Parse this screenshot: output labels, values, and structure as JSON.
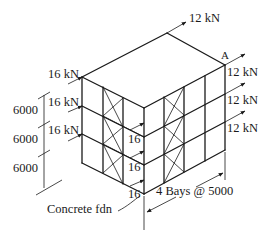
{
  "diagram": {
    "type": "isometric-braced-frame",
    "loads": {
      "top_back": "12 kN",
      "left_face": [
        "16 kN",
        "16 kN",
        "16 kN"
      ],
      "right_face": [
        "12 kN",
        "12 kN",
        "12 kN"
      ],
      "front_corner": [
        "16",
        "16",
        "16"
      ]
    },
    "corner_label": "A",
    "story_heights": [
      "6000",
      "6000",
      "6000"
    ],
    "foundation_label": "Concrete fdn",
    "bays_label": "4 Bays @ 5000",
    "colors": {
      "line": "#1a1a1a",
      "background": "#ffffff"
    }
  }
}
